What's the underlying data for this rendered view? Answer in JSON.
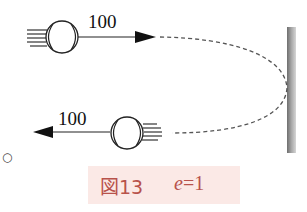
{
  "diagram": {
    "incoming": {
      "speed_label": "100",
      "direction": "right"
    },
    "outgoing": {
      "speed_label": "100",
      "direction": "left"
    },
    "wall": {
      "color": "#8f8f8f"
    },
    "path": {
      "style": "dashed",
      "color": "#555555"
    }
  },
  "caption": {
    "figure_label": "図13",
    "variable": "e",
    "equals": "=1",
    "text_color": "#b8524b",
    "background": "#fbe9e6"
  },
  "marker": {
    "symbol": "○"
  }
}
